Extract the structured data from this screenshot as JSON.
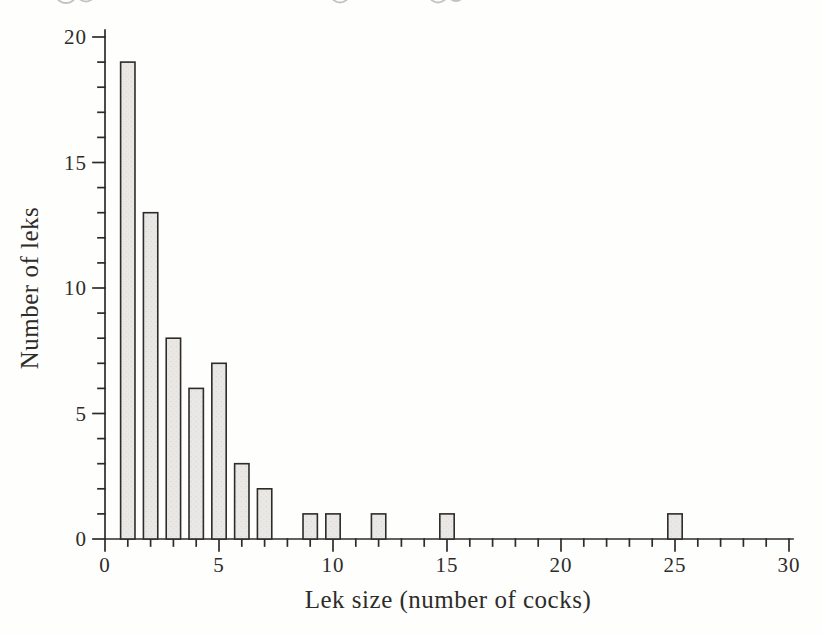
{
  "figure": {
    "kind": "scanned-book-histogram",
    "background": "#fefefd"
  },
  "chart_data": {
    "type": "bar",
    "title": "",
    "xlabel": "Lek size (number of cocks)",
    "ylabel": "Number of leks",
    "x": [
      1,
      2,
      3,
      4,
      5,
      6,
      7,
      9,
      10,
      12,
      15,
      25
    ],
    "values": [
      19,
      13,
      8,
      6,
      7,
      3,
      2,
      1,
      1,
      1,
      1,
      1
    ],
    "xlim": [
      0,
      30
    ],
    "ylim": [
      0,
      20
    ],
    "x_major_ticks": [
      0,
      5,
      10,
      15,
      20,
      25,
      30
    ],
    "x_minor_tick_step": 1,
    "y_major_ticks": [
      0,
      5,
      10,
      15,
      20
    ],
    "y_minor_tick_step": 1,
    "bar_width_units": 0.63,
    "grid": false,
    "legend_position": "none",
    "colors": {
      "bar_fill": "#e9e8e5",
      "bar_speckle": "#d4d2cd",
      "bar_stroke": "#2d2c29",
      "axis": "#2d2c29",
      "text": "#2d2c29"
    }
  }
}
